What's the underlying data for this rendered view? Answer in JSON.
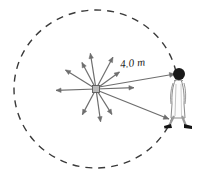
{
  "figure": {
    "background_color": "#ffffff"
  },
  "labels": {
    "distance": "4.0 m"
  },
  "circle": {
    "center_x": 96,
    "center_y": 89,
    "radius_x": 82,
    "radius_y": 79,
    "stroke_color": "#3a3a3a",
    "stroke_width": 1.4,
    "dash_pattern": "7 6",
    "style": "dashed"
  },
  "source": {
    "label": "point-source",
    "x": 96,
    "y": 89,
    "size": 7,
    "fill_color": "#b9b9b9",
    "stroke_color": "#5a5a5a"
  },
  "radial_arrows": {
    "stroke_color": "#6e6e6e",
    "stroke_width": 1.2,
    "count": 10,
    "vectors": [
      {
        "name": "arrow-up-left-far",
        "angle_deg": 148,
        "length": 36
      },
      {
        "name": "arrow-up-left",
        "angle_deg": 118,
        "length": 30
      },
      {
        "name": "arrow-up",
        "angle_deg": 99,
        "length": 36
      },
      {
        "name": "arrow-up-right",
        "angle_deg": 62,
        "length": 36
      },
      {
        "name": "arrow-up-right-near",
        "angle_deg": 36,
        "length": 29
      },
      {
        "name": "arrow-right",
        "angle_deg": 2,
        "length": 38
      },
      {
        "name": "arrow-down-right",
        "angle_deg": -58,
        "length": 30
      },
      {
        "name": "arrow-down",
        "angle_deg": -82,
        "length": 33
      },
      {
        "name": "arrow-down-left",
        "angle_deg": -118,
        "length": 29
      },
      {
        "name": "arrow-left",
        "angle_deg": 182,
        "length": 40
      }
    ]
  },
  "distance_lines": {
    "stroke_color": "#6e6e6e",
    "stroke_width": 1.2,
    "upper": {
      "name": "line-to-head",
      "x1": 99,
      "y1": 87,
      "x2": 175,
      "y2": 74
    },
    "lower": {
      "name": "line-to-feet",
      "x1": 99,
      "y1": 91,
      "x2": 169,
      "y2": 119
    }
  },
  "person": {
    "label": "walking-person",
    "head_x": 179,
    "head_y": 74,
    "head_radius": 6,
    "head_color": "#1a1a1a",
    "body_color": "#fdfdfd",
    "outline_color": "#8a8a8a",
    "shoe_color": "#141414"
  }
}
